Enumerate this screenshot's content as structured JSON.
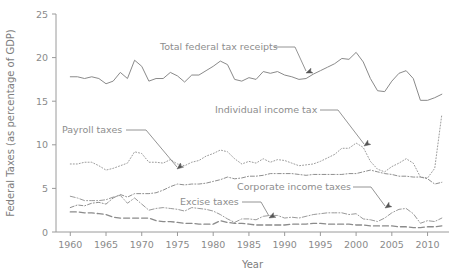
{
  "chart_data": {
    "type": "line",
    "title": "",
    "xlabel": "Year",
    "ylabel": "Federal Taxes (as percentage of GDP)",
    "xlim": [
      1958,
      2013
    ],
    "ylim": [
      0,
      25
    ],
    "xticks": [
      1960,
      1965,
      1970,
      1975,
      1980,
      1985,
      1990,
      1995,
      2000,
      2005,
      2010
    ],
    "yticks": [
      0,
      5,
      10,
      15,
      20,
      25
    ],
    "grid": false,
    "legend": "annotations",
    "x": [
      1960,
      1961,
      1962,
      1963,
      1964,
      1965,
      1966,
      1967,
      1968,
      1969,
      1970,
      1971,
      1972,
      1973,
      1974,
      1975,
      1976,
      1977,
      1978,
      1979,
      1980,
      1981,
      1982,
      1983,
      1984,
      1985,
      1986,
      1987,
      1988,
      1989,
      1990,
      1991,
      1992,
      1993,
      1994,
      1995,
      1996,
      1997,
      1998,
      1999,
      2000,
      2001,
      2002,
      2003,
      2004,
      2005,
      2006,
      2007,
      2008,
      2009,
      2010,
      2011,
      2012
    ],
    "series": [
      {
        "name": "Total federal tax receipts",
        "color": "#8a8a8a",
        "dash": "none",
        "width": 1.0,
        "values": [
          17.8,
          17.8,
          17.6,
          17.8,
          17.6,
          17.0,
          17.3,
          18.3,
          17.6,
          19.7,
          19.0,
          17.3,
          17.6,
          17.6,
          18.3,
          17.9,
          17.2,
          18.0,
          18.0,
          18.5,
          19.0,
          19.6,
          19.2,
          17.5,
          17.3,
          17.7,
          17.5,
          18.4,
          18.2,
          18.4,
          18.0,
          17.8,
          17.5,
          17.6,
          18.1,
          18.5,
          18.9,
          19.3,
          19.9,
          19.8,
          20.6,
          19.5,
          17.6,
          16.2,
          16.1,
          17.3,
          18.2,
          18.5,
          17.6,
          15.1,
          15.1,
          15.4,
          15.8
        ]
      },
      {
        "name": "Individual income tax",
        "color": "#9c9c9c",
        "dash": "1,2",
        "width": 1.0,
        "values": [
          7.8,
          7.8,
          8.0,
          8.0,
          7.6,
          7.1,
          7.3,
          7.6,
          7.9,
          9.2,
          9.0,
          8.0,
          8.0,
          7.9,
          8.3,
          7.8,
          7.6,
          8.0,
          8.2,
          8.7,
          9.0,
          9.4,
          9.2,
          8.4,
          7.8,
          8.1,
          7.9,
          8.4,
          8.0,
          8.3,
          8.2,
          7.9,
          7.6,
          7.7,
          7.8,
          8.1,
          8.5,
          8.9,
          9.6,
          9.6,
          10.2,
          9.7,
          8.1,
          7.2,
          6.9,
          7.5,
          7.9,
          8.4,
          7.9,
          6.3,
          6.2,
          7.3,
          13.5
        ]
      },
      {
        "name": "Payroll taxes",
        "color": "#8f8f8f",
        "dash": "4,2,1,2",
        "width": 1.0,
        "values": [
          2.8,
          3.1,
          3.0,
          3.3,
          3.4,
          3.2,
          3.9,
          4.3,
          4.0,
          4.4,
          4.4,
          4.4,
          4.5,
          4.8,
          5.2,
          5.5,
          5.4,
          5.5,
          5.5,
          5.6,
          5.8,
          6.0,
          6.3,
          6.1,
          6.2,
          6.4,
          6.4,
          6.5,
          6.7,
          6.7,
          6.7,
          6.7,
          6.6,
          6.5,
          6.6,
          6.6,
          6.6,
          6.6,
          6.6,
          6.7,
          6.7,
          6.9,
          7.1,
          6.9,
          6.7,
          6.6,
          6.4,
          6.4,
          6.3,
          6.3,
          6.1,
          5.5,
          5.7
        ]
      },
      {
        "name": "Corporate income taxes",
        "color": "#9a9a9a",
        "dash": "5,2,1,2",
        "width": 1.0,
        "values": [
          4.1,
          3.9,
          3.6,
          3.6,
          3.6,
          3.7,
          4.0,
          4.2,
          3.3,
          3.9,
          3.2,
          2.5,
          2.7,
          2.8,
          2.7,
          2.6,
          2.4,
          2.8,
          2.7,
          2.6,
          2.4,
          2.0,
          1.5,
          1.1,
          1.5,
          1.5,
          1.4,
          1.8,
          1.9,
          1.9,
          1.6,
          1.7,
          1.6,
          1.8,
          2.0,
          2.1,
          2.2,
          2.2,
          2.2,
          2.0,
          2.1,
          1.5,
          1.4,
          1.2,
          1.6,
          2.2,
          2.6,
          2.7,
          2.1,
          1.0,
          1.3,
          1.2,
          1.6
        ]
      },
      {
        "name": "Excise taxes",
        "color": "#8b8b8b",
        "dash": "6,3",
        "width": 1.3,
        "values": [
          2.3,
          2.3,
          2.2,
          2.2,
          2.1,
          2.0,
          1.7,
          1.6,
          1.6,
          1.6,
          1.6,
          1.6,
          1.3,
          1.2,
          1.2,
          1.1,
          1.0,
          1.0,
          0.9,
          0.9,
          0.9,
          1.3,
          1.1,
          1.0,
          1.0,
          0.9,
          0.8,
          0.8,
          0.8,
          0.8,
          0.8,
          0.9,
          0.9,
          0.9,
          1.0,
          1.0,
          0.9,
          0.9,
          0.9,
          0.9,
          0.8,
          0.8,
          0.7,
          0.7,
          0.7,
          0.7,
          0.6,
          0.6,
          0.5,
          0.5,
          0.6,
          0.6,
          0.7
        ]
      }
    ],
    "annotations": [
      {
        "name": "total-federal-tax-receipts",
        "text": "Total federal tax receipts",
        "text_x": 160,
        "text_y": 50,
        "leader": "M 274 47 L 295 47 L 306 71",
        "arrow_x": 306,
        "arrow_y": 73,
        "arrow_rot": 68
      },
      {
        "name": "individual-income-tax",
        "text": "Individual income tax",
        "text_x": 215,
        "text_y": 113,
        "leader": "M 320 110 L 338 110 L 364 144",
        "arrow_x": 364,
        "arrow_y": 146,
        "arrow_rot": 55
      },
      {
        "name": "payroll-taxes",
        "text": "Payroll taxes",
        "text_x": 62,
        "text_y": 133,
        "leader": "M 126 130 L 146 130 L 177 167",
        "arrow_x": 177,
        "arrow_y": 169,
        "arrow_rot": 52
      },
      {
        "name": "corporate-income-taxes",
        "text": "Corporate income taxes",
        "text_x": 237,
        "text_y": 190,
        "leader": "M 353 187 L 371 187 L 385 206",
        "arrow_x": 385,
        "arrow_y": 208,
        "arrow_rot": 57
      },
      {
        "name": "excise-taxes",
        "text": "Excise taxes",
        "text_x": 180,
        "text_y": 205,
        "leader": "M 242 202 L 261 202 L 269 216",
        "arrow_x": 269,
        "arrow_y": 218,
        "arrow_rot": 62
      }
    ]
  }
}
